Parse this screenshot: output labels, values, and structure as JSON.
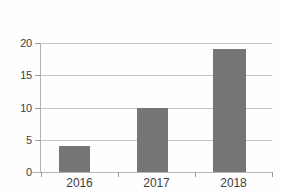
{
  "chart_data": {
    "type": "bar",
    "title": "",
    "subtitle": "",
    "xlabel": "",
    "ylabel": "",
    "categories": [
      "2016",
      "2017",
      "2018"
    ],
    "values": [
      4,
      10,
      19
    ],
    "series": [
      {
        "name": "",
        "values": [
          4,
          10,
          19
        ]
      }
    ],
    "ylim": [
      0,
      20
    ],
    "yticks": [
      0,
      5,
      10,
      15,
      20
    ],
    "ytick_labels": [
      "0",
      "5",
      "10",
      "15",
      "20"
    ],
    "grid": true,
    "grid_axis": "y",
    "legend": false,
    "legend_position": "none",
    "colors": {
      "bar": "#767676",
      "gridline": "#c6c6c6",
      "axis": "#b4b4b4",
      "text": "#3f3f3f",
      "background": "#fefefe"
    }
  }
}
